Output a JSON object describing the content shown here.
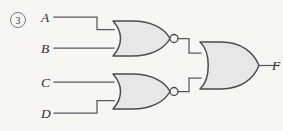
{
  "figure": {
    "item_number": "3",
    "item_number_icon": "circled-number-icon",
    "background_color": "#f7f6f3",
    "gate_fill_color": "#e7e7e7",
    "gate_stroke_color": "#4a4d51",
    "wire_color": "#55585c"
  },
  "inputs": [
    {
      "label": "A",
      "name": "input-a"
    },
    {
      "label": "B",
      "name": "input-b"
    },
    {
      "label": "C",
      "name": "input-c"
    },
    {
      "label": "D",
      "name": "input-d"
    }
  ],
  "outputs": [
    {
      "label": "F",
      "name": "output-f"
    }
  ],
  "gates": [
    {
      "name": "nor-gate-top",
      "type": "NOR",
      "inputs": [
        "A",
        "B"
      ],
      "has_bubble": true
    },
    {
      "name": "nor-gate-bottom",
      "type": "NOR",
      "inputs": [
        "C",
        "D"
      ],
      "has_bubble": true
    },
    {
      "name": "or-gate-output",
      "type": "OR",
      "inputs": [
        "nor-gate-top",
        "nor-gate-bottom"
      ],
      "has_bubble": false
    }
  ]
}
